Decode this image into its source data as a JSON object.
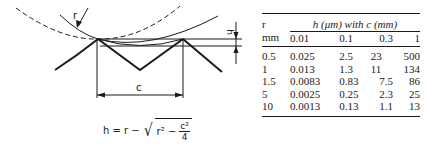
{
  "figure": {
    "labels": {
      "radius": "r",
      "height": "h",
      "chord": "c"
    },
    "formula": {
      "lhs": "h = r −",
      "radicand_start": "r² −",
      "numerator": "c²",
      "denominator": "4"
    }
  },
  "table": {
    "row_header_top": "r",
    "row_header_unit": "mm",
    "span_header": "h (μm) with c (mm)",
    "columns": [
      "0.01",
      "0.1",
      "0.3",
      "1"
    ],
    "rows": [
      {
        "r": "0.5",
        "values": [
          "0.025",
          "2.5",
          "23",
          "500"
        ]
      },
      {
        "r": "1",
        "values": [
          "0.013",
          "1.3",
          "11",
          "134"
        ]
      },
      {
        "r": "1.5",
        "values": [
          "0.0083",
          "0.83",
          "7.5",
          "86"
        ]
      },
      {
        "r": "5",
        "values": [
          "0.0025",
          "0.25",
          "2.3",
          "25"
        ]
      },
      {
        "r": "10",
        "values": [
          "0.0013",
          "0.13",
          "1.1",
          "13"
        ]
      }
    ]
  }
}
